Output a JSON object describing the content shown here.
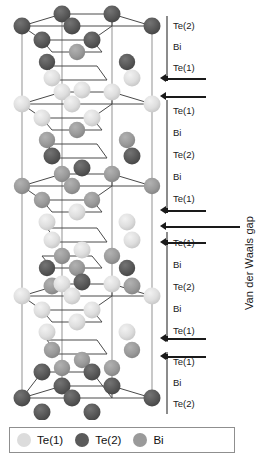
{
  "figure": {
    "type": "crystal-structure-diagram",
    "material": "Bi2Te3",
    "vdw_label": "Van der Waals gap"
  },
  "colors": {
    "te1": "#dcdcdc",
    "te2": "#5a5a5a",
    "bi": "#9a9a9a",
    "bond": "#4a4a4a",
    "cell_edge": "#9c9c9c",
    "arrow": "#1a1a1a",
    "spine": "#8c8c8c",
    "legend_border": "#8f8f8f",
    "background": "#ffffff"
  },
  "legend": {
    "items": [
      {
        "label": "Te(1)",
        "color": "#dcdcdc"
      },
      {
        "label": "Te(2)",
        "color": "#5a5a5a"
      },
      {
        "label": "Bi",
        "color": "#9a9a9a"
      }
    ]
  },
  "label_groups": [
    {
      "name": "group-top-partial",
      "top": 16,
      "height": 62,
      "labels": [
        "Te(2)",
        "Bi",
        "Te(1)"
      ]
    },
    {
      "name": "group-middle-upper",
      "top": 100,
      "height": 110,
      "labels": [
        "Te(1)",
        "Bi",
        "Te(2)",
        "Bi",
        "Te(1)"
      ]
    },
    {
      "name": "group-middle-lower",
      "top": 232,
      "height": 110,
      "labels": [
        "Te(1)",
        "Bi",
        "Te(2)",
        "Bi",
        "Te(1)"
      ]
    },
    {
      "name": "group-bottom-partial",
      "top": 352,
      "height": 62,
      "labels": [
        "Te(1)",
        "Bi",
        "Te(2)"
      ]
    }
  ],
  "gap_arrows": [
    {
      "name": "vdw-arrow-upper-a",
      "top": 74,
      "length": 46
    },
    {
      "name": "vdw-arrow-upper-b",
      "top": 92,
      "length": 46
    },
    {
      "name": "vdw-arrow-mid-a",
      "top": 206,
      "length": 46
    },
    {
      "name": "vdw-arrow-mid-long",
      "top": 222,
      "length": 80
    },
    {
      "name": "vdw-arrow-mid-b",
      "top": 238,
      "length": 46
    },
    {
      "name": "vdw-arrow-lower-a",
      "top": 334,
      "length": 46
    },
    {
      "name": "vdw-arrow-lower-b",
      "top": 352,
      "length": 46
    }
  ],
  "atom_sequence_unit": [
    "Te(1)",
    "Bi",
    "Te(2)",
    "Bi",
    "Te(1)"
  ]
}
